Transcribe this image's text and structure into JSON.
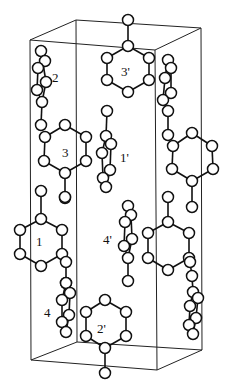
{
  "figure": {
    "background": "#ffffff",
    "stroke_color": "#111111",
    "atom_radius": 5.5
  },
  "unit_cell": {
    "edges": [
      [
        76,
        20,
        201,
        28
      ],
      [
        30,
        40,
        155,
        50
      ],
      [
        76,
        20,
        30,
        40
      ],
      [
        201,
        28,
        155,
        50
      ],
      [
        30,
        40,
        31,
        360
      ],
      [
        155,
        50,
        157,
        370
      ],
      [
        76,
        20,
        77,
        342
      ],
      [
        201,
        28,
        202,
        350
      ],
      [
        31,
        360,
        157,
        370
      ],
      [
        77,
        342,
        202,
        350
      ],
      [
        31,
        360,
        77,
        342
      ],
      [
        157,
        370,
        202,
        350
      ]
    ]
  },
  "labels": [
    {
      "id": "label-3prime",
      "text": "3'",
      "x": 121,
      "y": 76
    },
    {
      "id": "label-2",
      "text": "2",
      "x": 52,
      "y": 82
    },
    {
      "id": "label-3",
      "text": "3",
      "x": 62,
      "y": 157
    },
    {
      "id": "label-1prime",
      "text": "1'",
      "x": 120,
      "y": 162
    },
    {
      "id": "label-1",
      "text": "1",
      "x": 36,
      "y": 246
    },
    {
      "id": "label-4prime",
      "text": "4'",
      "x": 103,
      "y": 244
    },
    {
      "id": "label-4",
      "text": "4",
      "x": 44,
      "y": 317
    },
    {
      "id": "label-2prime",
      "text": "2'",
      "x": 97,
      "y": 333
    }
  ],
  "molecules": [
    {
      "id": "molecule-3prime",
      "atoms": [
        [
          128,
          20
        ],
        [
          128,
          46
        ],
        [
          107,
          58
        ],
        [
          149,
          58
        ],
        [
          107,
          80
        ],
        [
          149,
          80
        ],
        [
          128,
          92
        ]
      ],
      "bonds": [
        [
          0,
          1
        ],
        [
          1,
          2
        ],
        [
          1,
          3
        ],
        [
          2,
          4
        ],
        [
          3,
          5
        ],
        [
          4,
          6
        ],
        [
          5,
          6
        ]
      ]
    },
    {
      "id": "molecule-2",
      "atoms": [
        [
          41,
          51
        ],
        [
          45,
          61
        ],
        [
          38,
          68
        ],
        [
          46,
          82
        ],
        [
          37,
          90
        ],
        [
          42,
          102
        ],
        [
          41,
          125
        ]
      ],
      "bonds": [
        [
          0,
          1
        ],
        [
          1,
          2
        ],
        [
          0,
          3
        ],
        [
          2,
          4
        ],
        [
          3,
          4
        ],
        [
          4,
          5
        ],
        [
          3,
          5
        ],
        [
          5,
          6
        ]
      ]
    },
    {
      "id": "molecule-3",
      "atoms": [
        [
          45,
          137
        ],
        [
          65,
          125
        ],
        [
          86,
          137
        ],
        [
          86,
          161
        ],
        [
          65,
          173
        ],
        [
          44,
          161
        ],
        [
          65,
          198
        ]
      ],
      "bonds": [
        [
          0,
          1
        ],
        [
          1,
          2
        ],
        [
          2,
          3
        ],
        [
          3,
          4
        ],
        [
          4,
          5
        ],
        [
          5,
          0
        ],
        [
          4,
          6
        ]
      ]
    },
    {
      "id": "molecule-1prime",
      "atoms": [
        [
          107,
          111
        ],
        [
          106,
          136
        ],
        [
          111,
          144
        ],
        [
          102,
          153
        ],
        [
          110,
          170
        ],
        [
          103,
          178
        ],
        [
          106,
          187
        ]
      ],
      "bonds": [
        [
          0,
          1
        ],
        [
          1,
          2
        ],
        [
          1,
          3
        ],
        [
          2,
          4
        ],
        [
          3,
          5
        ],
        [
          4,
          6
        ],
        [
          5,
          6
        ]
      ]
    },
    {
      "id": "molecule-1",
      "atoms": [
        [
          41,
          191
        ],
        [
          41,
          219
        ],
        [
          20,
          230
        ],
        [
          62,
          230
        ],
        [
          20,
          254
        ],
        [
          62,
          254
        ],
        [
          41,
          266
        ]
      ],
      "bonds": [
        [
          0,
          1
        ],
        [
          1,
          2
        ],
        [
          1,
          3
        ],
        [
          2,
          4
        ],
        [
          3,
          5
        ],
        [
          4,
          6
        ],
        [
          5,
          6
        ]
      ]
    },
    {
      "id": "molecule-1-sidechain",
      "atoms": [
        [
          65,
          197
        ],
        [
          66,
          262
        ],
        [
          66,
          283
        ]
      ],
      "bonds": [
        [
          1,
          2
        ]
      ]
    },
    {
      "id": "molecule-4",
      "atoms": [
        [
          66,
          283
        ],
        [
          70,
          293
        ],
        [
          62,
          300
        ],
        [
          69,
          315
        ],
        [
          62,
          322
        ],
        [
          66,
          332
        ]
      ],
      "bonds": [
        [
          0,
          1
        ],
        [
          0,
          2
        ],
        [
          1,
          3
        ],
        [
          2,
          4
        ],
        [
          3,
          5
        ],
        [
          4,
          5
        ]
      ]
    },
    {
      "id": "molecule-4prime",
      "atoms": [
        [
          128,
          206
        ],
        [
          131,
          215
        ],
        [
          125,
          222
        ],
        [
          132,
          239
        ],
        [
          124,
          246
        ],
        [
          128,
          258
        ],
        [
          128,
          281
        ]
      ],
      "bonds": [
        [
          0,
          1
        ],
        [
          0,
          2
        ],
        [
          1,
          3
        ],
        [
          2,
          4
        ],
        [
          3,
          5
        ],
        [
          4,
          5
        ],
        [
          5,
          6
        ]
      ]
    },
    {
      "id": "molecule-right-lower-ring",
      "atoms": [
        [
          168,
          197
        ],
        [
          168,
          222
        ],
        [
          148,
          233
        ],
        [
          189,
          233
        ],
        [
          148,
          258
        ],
        [
          189,
          258
        ],
        [
          168,
          270
        ]
      ],
      "bonds": [
        [
          0,
          1
        ],
        [
          1,
          2
        ],
        [
          1,
          3
        ],
        [
          2,
          4
        ],
        [
          3,
          5
        ],
        [
          4,
          6
        ],
        [
          5,
          6
        ]
      ]
    },
    {
      "id": "molecule-2prime",
      "atoms": [
        [
          105,
          300
        ],
        [
          86,
          312
        ],
        [
          126,
          312
        ],
        [
          86,
          336
        ],
        [
          126,
          336
        ],
        [
          105,
          348
        ],
        [
          105,
          373
        ]
      ],
      "bonds": [
        [
          0,
          1
        ],
        [
          0,
          2
        ],
        [
          1,
          3
        ],
        [
          2,
          4
        ],
        [
          3,
          5
        ],
        [
          4,
          5
        ],
        [
          5,
          6
        ]
      ]
    },
    {
      "id": "molecule-right-upper-side",
      "atoms": [
        [
          168,
          60
        ],
        [
          171,
          68
        ],
        [
          165,
          78
        ],
        [
          171,
          93
        ],
        [
          163,
          100
        ],
        [
          168,
          111
        ],
        [
          168,
          135
        ]
      ],
      "bonds": [
        [
          0,
          1
        ],
        [
          0,
          2
        ],
        [
          1,
          3
        ],
        [
          2,
          4
        ],
        [
          3,
          4
        ],
        [
          4,
          5
        ],
        [
          5,
          6
        ]
      ]
    },
    {
      "id": "molecule-right-mid-ring",
      "atoms": [
        [
          173,
          146
        ],
        [
          192,
          133
        ],
        [
          212,
          146
        ],
        [
          213,
          169
        ],
        [
          192,
          181
        ],
        [
          172,
          169
        ],
        [
          192,
          207
        ]
      ],
      "bonds": [
        [
          0,
          1
        ],
        [
          1,
          2
        ],
        [
          2,
          3
        ],
        [
          3,
          4
        ],
        [
          4,
          5
        ],
        [
          5,
          0
        ],
        [
          4,
          6
        ]
      ]
    },
    {
      "id": "molecule-right-lower-side",
      "atoms": [
        [
          190,
          262
        ],
        [
          192,
          276
        ],
        [
          193,
          292
        ],
        [
          198,
          298
        ],
        [
          190,
          306
        ],
        [
          196,
          318
        ],
        [
          189,
          325
        ],
        [
          193,
          334
        ]
      ],
      "bonds": [
        [
          0,
          1
        ],
        [
          1,
          2
        ],
        [
          2,
          3
        ],
        [
          2,
          4
        ],
        [
          3,
          5
        ],
        [
          4,
          6
        ],
        [
          5,
          7
        ],
        [
          6,
          7
        ]
      ]
    }
  ]
}
